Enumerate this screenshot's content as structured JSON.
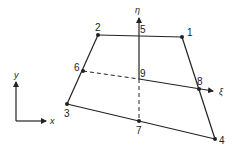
{
  "diagram": {
    "type": "quadrilateral-element-natural-coordinates",
    "colors": {
      "line": "#222222",
      "background": "#ffffff"
    },
    "global_axes": {
      "x_label": "x",
      "y_label": "y"
    },
    "natural_axes": {
      "xi_label": "ξ",
      "eta_label": "η"
    },
    "nodes": [
      {
        "id": "1",
        "label": "1"
      },
      {
        "id": "2",
        "label": "2"
      },
      {
        "id": "3",
        "label": "3"
      },
      {
        "id": "4",
        "label": "4"
      },
      {
        "id": "5",
        "label": "5"
      },
      {
        "id": "6",
        "label": "6"
      },
      {
        "id": "7",
        "label": "7"
      },
      {
        "id": "8",
        "label": "8"
      },
      {
        "id": "9",
        "label": "9"
      }
    ]
  }
}
